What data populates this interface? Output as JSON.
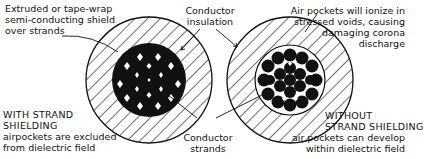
{
  "labels": {
    "shield": {
      "line1": "Extruded or tape-wrap",
      "line2": "semi-conducting shield",
      "line3": "over strands"
    },
    "insulation": {
      "line1": "Conductor",
      "line2": "insulation"
    },
    "air_pockets": {
      "line1": "Air pockets will ionize in",
      "line2": "stressed voids, causing",
      "line3": "damaging corona",
      "line4": "discharge"
    },
    "with_shielding": {
      "title1": "WITH STRAND",
      "title2": "SHIELDING",
      "line1": "airpockets are excluded",
      "line2": "from dielectric field"
    },
    "strands": {
      "line1": "Conductor",
      "line2": "strands"
    },
    "without_shielding": {
      "title1": "WITHOUT",
      "title2": "STRAND SHIELDING",
      "line1": "air pockets can develop",
      "line2": "within dielectric field"
    }
  },
  "figures": [
    {
      "name": "cable-with-strand-shielding",
      "cx": 149,
      "cy": 80,
      "outer_r": 63,
      "inner_r": 36
    },
    {
      "name": "cable-without-strand-shielding",
      "cx": 290,
      "cy": 80,
      "outer_r": 63,
      "inner_r": 32
    }
  ],
  "colors": {
    "ink": "#111111",
    "background": "#ffffff"
  }
}
